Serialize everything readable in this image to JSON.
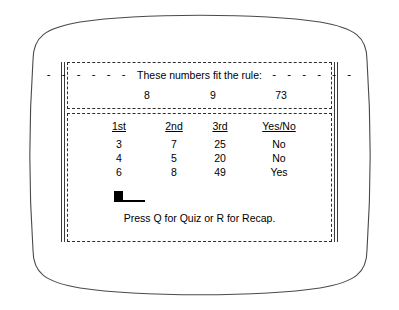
{
  "screen": {
    "rule_panel": {
      "dash_left": "- - - - - -",
      "banner_text": "These numbers fit the rule:",
      "dash_right": "- - - - - -",
      "numbers": [
        "8",
        "9",
        "73"
      ]
    },
    "table_panel": {
      "columns": [
        "1st",
        "2nd",
        "3rd",
        "Yes/No"
      ],
      "rows": [
        [
          "3",
          "7",
          "25",
          "No"
        ],
        [
          "4",
          "5",
          "20",
          "No"
        ],
        [
          "6",
          "8",
          "49",
          "Yes"
        ]
      ],
      "cursor": "block-cursor",
      "prompt": "Press Q for Quiz or R for Recap."
    }
  },
  "colors": {
    "ink": "#000000",
    "bezel_outline": "#4a4a4a",
    "dashed_border": "#2e2e2e",
    "background": "#ffffff"
  }
}
